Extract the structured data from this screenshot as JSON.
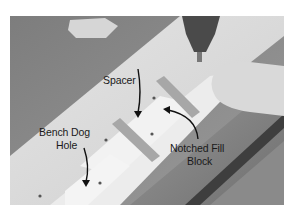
{
  "figure": {
    "labels": {
      "spacer": "Spacer",
      "bench_dog_hole_line1": "Bench Dog",
      "bench_dog_hole_line2": "Hole",
      "notched_fill_block_line1": "Notched Fill",
      "notched_fill_block_line2": "Block"
    }
  }
}
